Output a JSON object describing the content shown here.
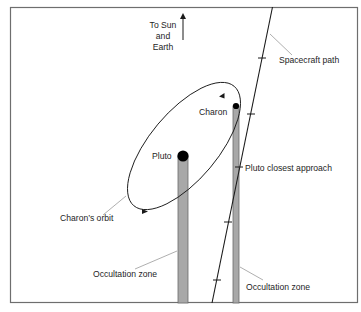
{
  "diagram": {
    "direction_label": {
      "lines": [
        "To Sun",
        "and",
        "Earth"
      ]
    },
    "labels": {
      "spacecraft_path": "Spacecraft path",
      "charon": "Charon",
      "pluto": "Pluto",
      "pluto_closest_approach": "Pluto closest approach",
      "charons_orbit": "Charon’s orbit",
      "occultation_zone_pluto": "Occultation zone",
      "occultation_zone_charon": "Occultation zone"
    },
    "colors": {
      "frame": "#6e6e6e",
      "line": "#1a1a1a",
      "occultation_fill": "#a8a8a8",
      "occultation_stroke": "#6a6a6a",
      "leader": "#9a9a9a",
      "body": "#000000"
    }
  }
}
